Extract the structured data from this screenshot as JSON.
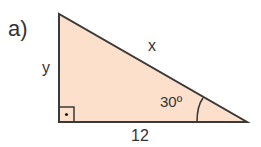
{
  "problem": {
    "part_label": "a)"
  },
  "triangle": {
    "fill_color": "#fce0cc",
    "stroke_color": "#3a3a3a",
    "vertices": {
      "top": [
        59,
        14
      ],
      "right_angle": [
        59,
        122
      ],
      "acute": [
        247,
        122
      ]
    },
    "sides": {
      "hypotenuse_label": "x",
      "vertical_label": "y",
      "base_label": "12"
    },
    "angle_label": "30º",
    "right_angle_marker": true
  }
}
